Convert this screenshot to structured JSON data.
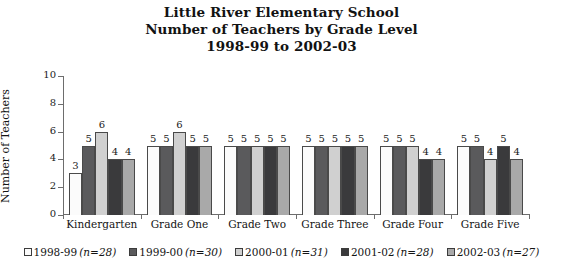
{
  "chart_data": {
    "type": "bar",
    "title": "Little River Elementary School\nNumber of Teachers by Grade Level\n1998-99 to 2002-03",
    "title_lines": [
      "Little River Elementary School",
      "Number of Teachers by Grade Level",
      "1998-99 to 2002-03"
    ],
    "xlabel": "",
    "ylabel": "Number of Teachers",
    "ylim": [
      0,
      10
    ],
    "ytick_labels": [
      "0",
      "2",
      "4",
      "6",
      "8",
      "10"
    ],
    "yticks": [
      0,
      2,
      4,
      6,
      8,
      10
    ],
    "grid": false,
    "legend_position": "bottom",
    "categories": [
      "Kindergarten",
      "Grade One",
      "Grade Two",
      "Grade Three",
      "Grade Four",
      "Grade Five"
    ],
    "series": [
      {
        "name": "1998-99 (n=28)",
        "label_year": "1998-99",
        "label_n": "(n=28)",
        "color": "#fbfbfb",
        "values": [
          3,
          5,
          5,
          5,
          5,
          5
        ]
      },
      {
        "name": "1999-00 (n=30)",
        "label_year": "1999-00",
        "label_n": "(n=30)",
        "color": "#5a5a5c",
        "values": [
          5,
          5,
          5,
          5,
          5,
          5
        ]
      },
      {
        "name": "2000-01 (n=31)",
        "label_year": "2000-01",
        "label_n": "(n=31)",
        "color": "#d0d0d0",
        "values": [
          6,
          6,
          5,
          5,
          5,
          4
        ]
      },
      {
        "name": "2001-02 (n=28)",
        "label_year": "2001-02",
        "label_n": "(n=28)",
        "color": "#3a3a3c",
        "values": [
          4,
          5,
          5,
          5,
          4,
          5
        ]
      },
      {
        "name": "2002-03 (n=27)",
        "label_year": "2002-03",
        "label_n": "(n=27)",
        "color": "#a9a9a9",
        "values": [
          4,
          5,
          5,
          5,
          4,
          4
        ]
      }
    ]
  }
}
